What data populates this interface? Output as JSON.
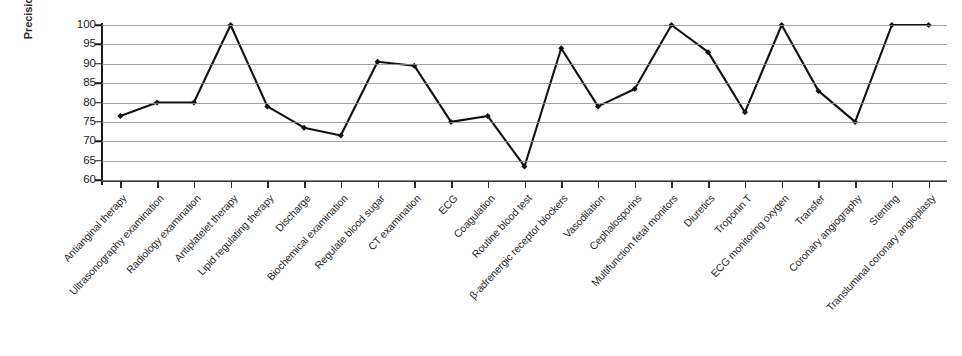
{
  "chart_data": {
    "type": "line",
    "title": "",
    "xlabel": "",
    "ylabel": "Precision (%)",
    "ylim": [
      60,
      100
    ],
    "yticks": [
      60,
      65,
      70,
      75,
      80,
      85,
      90,
      95,
      100
    ],
    "grid": true,
    "legend": "none",
    "marker": "diamond",
    "line_color": "#111111",
    "grid_color": "#8d8d8d",
    "categories": [
      "Antianginal therapy",
      "Ultrasonography examination",
      "Radiology examination",
      "Antiplatelet therapy",
      "Lipid regulating therapy",
      "Discharge",
      "Biochemical examination",
      "Regulate blood sugar",
      "CT examination",
      "ECG",
      "Coagulation",
      "Routine blood test",
      "β-adrenergic receptor blockers",
      "Vasodilation",
      "Cephalosporins",
      "Multifunction fetal monitors",
      "Diuretics",
      "Troponin T",
      "ECG monitoring oxygen",
      "Transfer",
      "Coronary angiography",
      "Stenting",
      "Transluminal coronary angioplasty"
    ],
    "values": [
      76.5,
      80,
      80,
      100,
      79,
      73.5,
      71.5,
      90.5,
      89.5,
      75,
      76.5,
      63.5,
      94,
      79,
      83.5,
      100,
      93,
      77.5,
      100,
      83,
      75,
      100,
      100
    ]
  }
}
